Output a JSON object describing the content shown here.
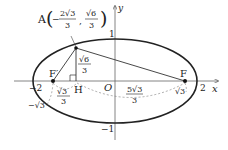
{
  "diagram": {
    "axes": {
      "x_label": "x",
      "y_label": "y",
      "origin_label": "O"
    },
    "ellipse": {
      "a": 2,
      "b": 1,
      "equation": "x^2/4 + y^2 = 1"
    },
    "points": {
      "A": {
        "name": "A",
        "coords_label_prefix": "A",
        "x_num": "2√3",
        "x_den": "3",
        "y_num": "√6",
        "y_den": "3"
      },
      "F": {
        "name": "F"
      },
      "F_prime": {
        "name": "F′"
      },
      "H": {
        "name": "H"
      },
      "O": {
        "name": "O"
      }
    },
    "tick_labels": {
      "x_neg2": "−2",
      "x_pos2": "2",
      "y_pos1": "1",
      "y_neg1": "−1",
      "x_neg_sqrt3": "−√3",
      "x_pos_sqrt3": "√3"
    },
    "segment_labels": {
      "AH_num": "√6",
      "AH_den": "3",
      "FpH_num": "√3",
      "FpH_den": "3",
      "HF_num": "5√3",
      "HF_den": "3"
    },
    "colors": {
      "stroke": "#222222",
      "axis": "#555555",
      "dashed": "#666666"
    }
  }
}
